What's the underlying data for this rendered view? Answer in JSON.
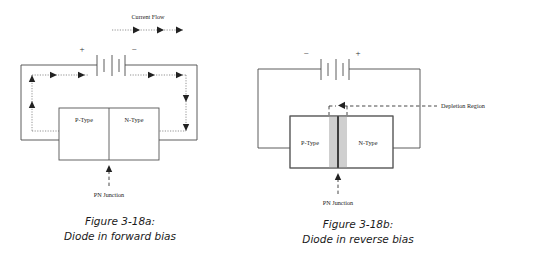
{
  "figure": {
    "background_color": "#ffffff",
    "line_color": "#4a4a4a",
    "text_color": "#1a1a1a",
    "depletion_fill": "#cfcfcf"
  },
  "panel_a": {
    "current_flow_label": "Current Flow",
    "battery_plus": "+",
    "battery_minus": "−",
    "p_type_label": "P-Type",
    "n_type_label": "N-Type",
    "pn_junction_label": "PN Junction",
    "caption_line1": "Figure 3-18a:",
    "caption_line2": "Diode in forward bias"
  },
  "panel_b": {
    "battery_minus": "−",
    "battery_plus": "+",
    "p_type_label": "P-Type",
    "n_type_label": "N-Type",
    "pn_junction_label": "PN Junction",
    "depletion_region_label": "Depletion Region",
    "caption_line1": "Figure 3-18b:",
    "caption_line2": "Diode in reverse bias"
  }
}
